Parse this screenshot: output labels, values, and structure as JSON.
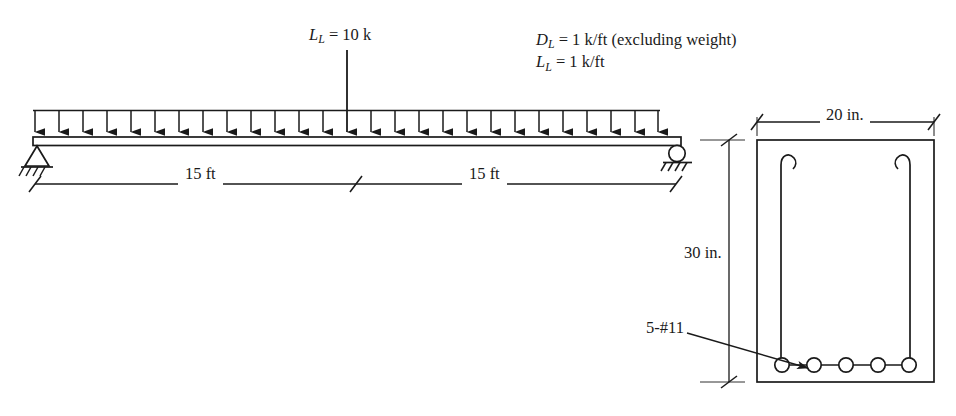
{
  "figure": {
    "stroke_color": "#1a1a1a",
    "background": "#ffffff"
  },
  "beam": {
    "point_load": {
      "symbol": "L",
      "subscript": "L",
      "text": "L_L = 10 k",
      "value": "10",
      "unit": "k",
      "label_html": "<i>L</i><sub>L</sub> = 10 k"
    },
    "distributed_loads": {
      "dead_load_text": "D_L = 1 k/ft (excluding weight)",
      "live_load_text": "L_L = 1 k/ft",
      "dead_load_html": "<i>D</i><sub>L</sub> = 1 k/ft (excluding weight)",
      "live_load_html": "<i>L</i><sub>L</sub> = 1 k/ft",
      "dead_load_value": "1",
      "live_load_value": "1",
      "unit": "k/ft",
      "note": "(excluding weight)",
      "arrow_count": 27
    },
    "supports": {
      "left": "pin-support",
      "right": "roller-support"
    },
    "dimensions": [
      {
        "label": "15 ft",
        "value": "15",
        "unit": "ft"
      },
      {
        "label": "15 ft",
        "value": "15",
        "unit": "ft"
      }
    ]
  },
  "cross_section": {
    "width": {
      "label": "20 in.",
      "value": "20",
      "unit": "in."
    },
    "depth": {
      "label": "30 in.",
      "value": "30",
      "unit": "in."
    },
    "reinforcement": {
      "label": "5-#11",
      "count": "5",
      "bar_size": "#11",
      "stirrup": "closed-stirrup-with-hooks"
    }
  }
}
